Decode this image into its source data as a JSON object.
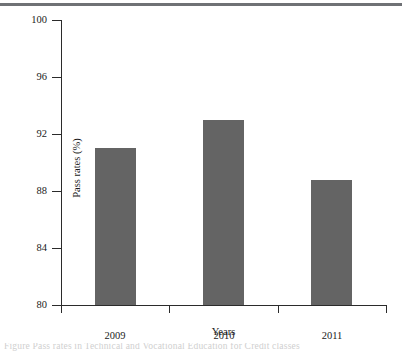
{
  "figure": {
    "has_top_rule": true,
    "background_color": "#ffffff",
    "caption_fragment": "Figure    Pass rates in  Technical and Vocational Education for Credit classes"
  },
  "chart_data": {
    "type": "bar",
    "title": "",
    "xlabel": "Years",
    "ylabel": "Pass rates (%)",
    "categories": [
      "2009",
      "2010",
      "2011"
    ],
    "values": [
      91.0,
      93.0,
      88.8
    ],
    "series": [
      {
        "name": "Pass rates",
        "values": [
          91.0,
          93.0,
          88.8
        ],
        "color": "#646464"
      }
    ],
    "ylim": [
      80,
      100
    ],
    "yticks": [
      80,
      84,
      88,
      92,
      96,
      100
    ],
    "ytick_labels": [
      "80",
      "84",
      "88",
      "92",
      "96",
      "100"
    ],
    "grid": false,
    "legend": "none",
    "bar_color": "#646464",
    "axis_color": "#2b2b2b"
  }
}
